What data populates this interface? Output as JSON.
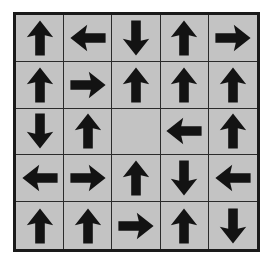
{
  "figure": {
    "name": "arrow-direction-grid",
    "rows": 5,
    "columns": 5,
    "cell_count": 25,
    "filled_cells": 24,
    "empty_cells": 1,
    "colors": {
      "page_background": "#ffffff",
      "cell_background": "#c3c3c3",
      "outer_border": "#1a1a1a",
      "grid_line": "#2b2b2b",
      "arrow_fill": "#131313"
    },
    "cells": [
      [
        {
          "icon": "arrow-up-icon",
          "direction": "up",
          "row": 1,
          "col": 1
        },
        {
          "icon": "arrow-left-icon",
          "direction": "left",
          "row": 1,
          "col": 2
        },
        {
          "icon": "arrow-down-icon",
          "direction": "down",
          "row": 1,
          "col": 3
        },
        {
          "icon": "arrow-up-icon",
          "direction": "up",
          "row": 1,
          "col": 4
        },
        {
          "icon": "arrow-right-icon",
          "direction": "right",
          "row": 1,
          "col": 5
        }
      ],
      [
        {
          "icon": "arrow-up-icon",
          "direction": "up",
          "row": 2,
          "col": 1
        },
        {
          "icon": "arrow-right-icon",
          "direction": "right",
          "row": 2,
          "col": 2
        },
        {
          "icon": "arrow-up-icon",
          "direction": "up",
          "row": 2,
          "col": 3
        },
        {
          "icon": "arrow-up-icon",
          "direction": "up",
          "row": 2,
          "col": 4
        },
        {
          "icon": "arrow-up-icon",
          "direction": "up",
          "row": 2,
          "col": 5
        }
      ],
      [
        {
          "icon": "arrow-down-icon",
          "direction": "down",
          "row": 3,
          "col": 1
        },
        {
          "icon": "arrow-up-icon",
          "direction": "up",
          "row": 3,
          "col": 2
        },
        {
          "icon": "empty-cell",
          "direction": "none",
          "row": 3,
          "col": 3
        },
        {
          "icon": "arrow-left-icon",
          "direction": "left",
          "row": 3,
          "col": 4
        },
        {
          "icon": "arrow-up-icon",
          "direction": "up",
          "row": 3,
          "col": 5
        }
      ],
      [
        {
          "icon": "arrow-left-icon",
          "direction": "left",
          "row": 4,
          "col": 1
        },
        {
          "icon": "arrow-right-icon",
          "direction": "right",
          "row": 4,
          "col": 2
        },
        {
          "icon": "arrow-up-icon",
          "direction": "up",
          "row": 4,
          "col": 3
        },
        {
          "icon": "arrow-down-icon",
          "direction": "down",
          "row": 4,
          "col": 4
        },
        {
          "icon": "arrow-left-icon",
          "direction": "left",
          "row": 4,
          "col": 5
        }
      ],
      [
        {
          "icon": "arrow-up-icon",
          "direction": "up",
          "row": 5,
          "col": 1
        },
        {
          "icon": "arrow-up-icon",
          "direction": "up",
          "row": 5,
          "col": 2
        },
        {
          "icon": "arrow-right-icon",
          "direction": "right",
          "row": 5,
          "col": 3
        },
        {
          "icon": "arrow-up-icon",
          "direction": "up",
          "row": 5,
          "col": 4
        },
        {
          "icon": "arrow-down-icon",
          "direction": "down",
          "row": 5,
          "col": 5
        }
      ]
    ]
  }
}
